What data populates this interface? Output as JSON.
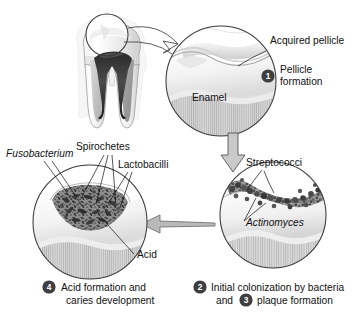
{
  "figure": {
    "background_color": "#ffffff",
    "line_color": "#3a3a3a",
    "badge_color": "#3f3f3f",
    "badge_text_color": "#ffffff"
  },
  "tooth": {
    "name": "molar-cross-section",
    "highlight_circle_label": ""
  },
  "panels": [
    {
      "id": "panel-1",
      "number": "1",
      "caption_line1": "Pellicle",
      "caption_line2": "formation",
      "labels": [
        {
          "text": "Acquired pellicle",
          "italic": false
        },
        {
          "text": "Enamel",
          "italic": false
        }
      ]
    },
    {
      "id": "panel-2",
      "number": "2",
      "second_number": "3",
      "caption_line1": "Initial colonization by bacteria",
      "caption_line2_pre": "and",
      "caption_line2_post": "plaque formation",
      "labels": [
        {
          "text": "Streptococci",
          "italic": false
        },
        {
          "text": "Actinomyces",
          "italic": true
        }
      ]
    },
    {
      "id": "panel-4",
      "number": "4",
      "caption_line1": "Acid formation and",
      "caption_line2": "caries development",
      "labels": [
        {
          "text": "Fusobacterium",
          "italic": true
        },
        {
          "text": "Spirochetes",
          "italic": false
        },
        {
          "text": "Lactobacilli",
          "italic": false
        },
        {
          "text": "Acid",
          "italic": false
        }
      ]
    }
  ],
  "text": {
    "acquired_pellicle": "Acquired pellicle",
    "enamel": "Enamel",
    "pellicle_line1": "Pellicle",
    "pellicle_line2": "formation",
    "streptococci": "Streptococci",
    "actinomyces": "Actinomyces",
    "colonization_line1": "Initial colonization by bacteria",
    "colonization_and": "and",
    "colonization_line2": "plaque formation",
    "fusobacterium": "Fusobacterium",
    "spirochetes": "Spirochetes",
    "lactobacilli": "Lactobacilli",
    "acid": "Acid",
    "acid_caption_line1": "Acid formation and",
    "acid_caption_line2": "caries development",
    "num1": "1",
    "num2": "2",
    "num3": "3",
    "num4": "4"
  }
}
